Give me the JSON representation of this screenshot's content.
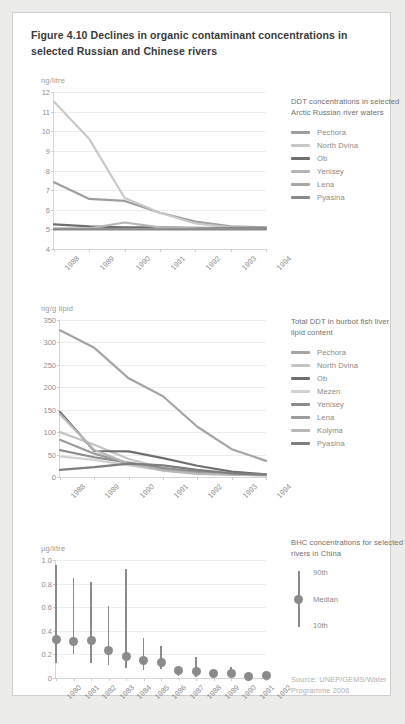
{
  "figure": {
    "title": "Figure 4.10 Declines in organic contaminant concentrations in selected Russian and Chinese rivers",
    "source": "Source: UNEP/GEMS/Water Programme 2006"
  },
  "chart_data": [
    {
      "type": "line",
      "title": "DDT concentrations in selected Arctic Russian river waters",
      "unit_label": "ng/litre",
      "xlabel": "",
      "ylabel": "ng/litre",
      "ylim": [
        4,
        12
      ],
      "yticks": [
        4,
        5,
        6,
        7,
        8,
        9,
        10,
        11,
        12
      ],
      "grid": true,
      "legend_position": "right",
      "categories": [
        "1988",
        "1989",
        "1990",
        "1991",
        "1992",
        "1993",
        "1994"
      ],
      "series": [
        {
          "name": "Pechora",
          "color": "#9e9e9e",
          "values": [
            7.4,
            6.55,
            6.45,
            5.85,
            5.4,
            5.15,
            5.1
          ]
        },
        {
          "name": "North Dvina",
          "color": "#c9c9c9",
          "values": [
            11.5,
            9.6,
            6.6,
            5.85,
            5.3,
            5.1,
            5.05
          ]
        },
        {
          "name": "Ob",
          "color": "#6f6f6f",
          "values": [
            5.25,
            5.15,
            5.1,
            5.1,
            5.08,
            5.06,
            5.05
          ]
        },
        {
          "name": "Yenisey",
          "color": "#b5b5b5",
          "values": [
            5.05,
            5.05,
            5.35,
            5.1,
            5.05,
            5.03,
            5.02
          ]
        },
        {
          "name": "Lena",
          "color": "#a8a8a8",
          "values": [
            5.02,
            5.02,
            5.02,
            5.02,
            5.02,
            5.02,
            5.02
          ]
        },
        {
          "name": "Pyasina",
          "color": "#8a8a8a",
          "values": [
            5.0,
            5.0,
            5.0,
            5.0,
            5.0,
            5.0,
            5.0
          ]
        }
      ]
    },
    {
      "type": "line",
      "title": "Total DDT in burbot fish liver lipid content",
      "unit_label": "ng/g lipid",
      "xlabel": "",
      "ylabel": "ng/g lipid",
      "ylim": [
        0,
        350
      ],
      "yticks": [
        0,
        50,
        100,
        150,
        200,
        250,
        300,
        350
      ],
      "grid": true,
      "legend_position": "right",
      "categories": [
        "1988",
        "1989",
        "1990",
        "1991",
        "1992",
        "1993",
        "1994"
      ],
      "series": [
        {
          "name": "Pechora",
          "color": "#a5a5a5",
          "values": [
            327,
            288,
            220,
            180,
            112,
            62,
            36
          ]
        },
        {
          "name": "North Dvina",
          "color": "#c4c4c4",
          "values": [
            100,
            72,
            40,
            20,
            10,
            6,
            5
          ]
        },
        {
          "name": "Ob",
          "color": "#6f6f6f",
          "values": [
            145,
            58,
            57,
            42,
            25,
            12,
            6
          ]
        },
        {
          "name": "Mezen",
          "color": "#d2d2d2",
          "values": [
            46,
            38,
            26,
            15,
            8,
            5,
            4
          ]
        },
        {
          "name": "Yenisey",
          "color": "#8c8c8c",
          "values": [
            60,
            44,
            32,
            20,
            12,
            7,
            5
          ]
        },
        {
          "name": "Lena",
          "color": "#9c9c9c",
          "values": [
            83,
            52,
            30,
            16,
            9,
            6,
            4
          ]
        },
        {
          "name": "Kolyma",
          "color": "#b8b8b8",
          "values": [
            140,
            60,
            30,
            14,
            7,
            5,
            4
          ]
        },
        {
          "name": "Pyasina",
          "color": "#7e7e7e",
          "values": [
            16,
            22,
            30,
            26,
            16,
            8,
            5
          ]
        }
      ]
    },
    {
      "type": "range",
      "title": "BHC concentrations for selected rivers in China",
      "unit_label": "µg/litre",
      "xlabel": "",
      "ylabel": "µg/litre",
      "ylim": [
        0,
        1.0
      ],
      "yticks": [
        "0",
        "0.2",
        "0.4",
        "0.6",
        "0.8",
        "1.0"
      ],
      "ytick_values": [
        0,
        0.2,
        0.4,
        0.6,
        0.8,
        1.0
      ],
      "grid": true,
      "legend_position": "right",
      "legend_items": [
        {
          "name": "90th",
          "marker": "line-top"
        },
        {
          "name": "Median",
          "marker": "dot"
        },
        {
          "name": "10th",
          "marker": "line-bottom"
        }
      ],
      "marker_color": "#8b8b8b",
      "categories": [
        "1980",
        "1981",
        "1982",
        "1983",
        "1984",
        "1985",
        "1986",
        "1987",
        "1988",
        "1989",
        "1990",
        "1991",
        "1992"
      ],
      "median": [
        0.33,
        0.31,
        0.32,
        0.23,
        0.185,
        0.15,
        0.13,
        0.06,
        0.055,
        0.04,
        0.04,
        0.015,
        0.02
      ],
      "p90": [
        0.96,
        0.85,
        0.81,
        0.61,
        0.92,
        0.34,
        0.27,
        0.085,
        0.175,
        0.075,
        0.095,
        0.04,
        0.045
      ],
      "p10": [
        0.13,
        0.2,
        0.13,
        0.11,
        0.085,
        0.065,
        0.075,
        0.02,
        0.012,
        0.012,
        0.012,
        0.005,
        0.008
      ]
    }
  ]
}
